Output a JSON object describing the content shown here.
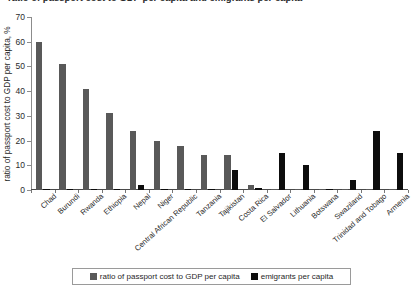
{
  "title_partial": "ratio of passport cost to GDP per capita and emigrants per capita",
  "chart_data": {
    "type": "bar",
    "title": "",
    "xlabel": "",
    "ylabel": "ratio of passport cost to GDP per capita, %",
    "ylim": [
      0,
      70
    ],
    "yticks": [
      0,
      10,
      20,
      30,
      40,
      50,
      60,
      70
    ],
    "grid": false,
    "legend_position": "bottom",
    "categories": [
      "Chad",
      "Burundi",
      "Rwanda",
      "Ethiopia",
      "Nepal",
      "Niger",
      "Central African Republic",
      "Tanzania",
      "Tajikistan",
      "Costa Rica",
      "El Salvador",
      "Lithuania",
      "Botswana",
      "Swaziland",
      "Trinidad and Tobago",
      "Armenia"
    ],
    "series": [
      {
        "name": "ratio of passport cost to GDP per capita",
        "color": "#595959",
        "values": [
          60,
          51,
          41,
          31,
          24,
          20,
          18,
          14,
          14,
          2,
          0.6,
          0.5,
          0.4,
          0.3,
          0.3,
          0.3
        ]
      },
      {
        "name": "emigrants per capita",
        "color": "#0d0d0d",
        "values": [
          0.3,
          0.3,
          0.4,
          0.4,
          2,
          0.3,
          0.4,
          0.5,
          8,
          0.8,
          15,
          10,
          0.5,
          4,
          24,
          15
        ]
      }
    ]
  },
  "legend": {
    "items": [
      {
        "label": "ratio of passport cost to GDP per capita",
        "color": "#595959"
      },
      {
        "label": "emigrants per capita",
        "color": "#0d0d0d"
      }
    ]
  }
}
